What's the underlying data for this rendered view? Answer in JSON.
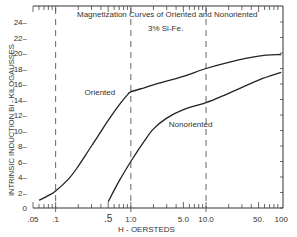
{
  "chart_data": {
    "type": "line",
    "title": "Magnetization Curves of Oriented and Nonoriented",
    "subtitle": "3% Si-Fe.",
    "xlabel": "H - OERSTEDS",
    "ylabel": "INTRINSIC INDUCTION  Bi - KILOGAUSSES",
    "xscale": "log",
    "xlim": [
      0.05,
      100
    ],
    "ylim": [
      0,
      26
    ],
    "x_tick_labels": [
      ".05",
      ".1",
      ".5",
      "1.0",
      "5.0",
      "10.0",
      "50.",
      "100"
    ],
    "x_tick_values": [
      0.05,
      0.1,
      0.5,
      1.0,
      5.0,
      10.0,
      50,
      100
    ],
    "y_tick_labels": [
      "0",
      "2",
      "4",
      "6",
      "8",
      "10",
      "12",
      "14",
      "16",
      "18",
      "20",
      "22",
      "24"
    ],
    "y_tick_values": [
      0,
      2,
      4,
      6,
      8,
      10,
      12,
      14,
      16,
      18,
      20,
      22,
      24
    ],
    "vertical_dashed_lines": [
      0.1,
      1.0,
      10.0
    ],
    "grid": false,
    "series": [
      {
        "name": "Oriented",
        "x": [
          0.06,
          0.08,
          0.1,
          0.15,
          0.2,
          0.3,
          0.5,
          0.7,
          0.9,
          1.0,
          1.5,
          2,
          5,
          10,
          20,
          50,
          100
        ],
        "y": [
          1.0,
          1.6,
          2.2,
          3.8,
          5.4,
          8.0,
          11.3,
          13.3,
          14.6,
          15.0,
          15.5,
          15.9,
          17.0,
          18.0,
          18.8,
          19.6,
          19.8
        ]
      },
      {
        "name": "Nonoriented",
        "x": [
          0.5,
          0.7,
          1.0,
          1.5,
          2,
          3,
          5,
          10,
          20,
          50,
          100
        ],
        "y": [
          0.8,
          3.5,
          6.0,
          8.6,
          10.2,
          11.6,
          12.7,
          13.6,
          14.8,
          16.5,
          17.5
        ]
      }
    ],
    "annotations": [
      {
        "text": "Oriented",
        "x": 0.62,
        "y": 15.0
      },
      {
        "text": "Nonoriented",
        "x": 3.2,
        "y": 10.8
      }
    ]
  }
}
